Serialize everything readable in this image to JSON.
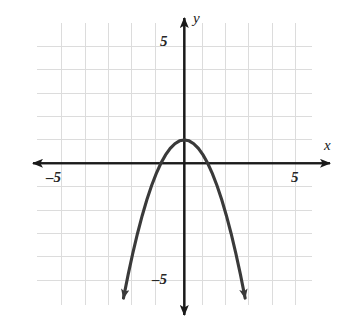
{
  "figure": {
    "kind": "coordinate-plane-graph",
    "background_color": "#ffffff",
    "grid_color": "#dcdcdc",
    "axis_color": "#1a1a1a",
    "curve_color": "#3a3a3a"
  },
  "labels": {
    "axis_x_name": "x",
    "axis_y_name": "y",
    "x_positive_tick": "5",
    "x_negative_tick": "–5",
    "y_positive_tick": "5",
    "y_negative_tick": "–5"
  },
  "chart_data": {
    "type": "line",
    "title": "",
    "subtitle": "",
    "xlabel": "x",
    "ylabel": "y",
    "xlim": [
      -6.3,
      5.1
    ],
    "ylim": [
      -6.0,
      6.0
    ],
    "grid": true,
    "grid_step": 1,
    "legend": "none",
    "x_ticks": [
      -5,
      5
    ],
    "x_tick_labels": [
      "–5",
      "5"
    ],
    "y_ticks": [
      -5,
      5
    ],
    "y_tick_labels": [
      "–5",
      "5"
    ],
    "axis_arrows": [
      "left",
      "right",
      "up",
      "down"
    ],
    "annotations": [],
    "series": [
      {
        "name": "y = 1 - x^2",
        "equation": "y = 1 - x²",
        "shape": "downward-opening parabola",
        "vertex": [
          0,
          1
        ],
        "x_intercepts": [
          -1,
          1
        ],
        "y_intercept": 1,
        "direction": "opens downward",
        "end_arrows": [
          "down-left",
          "down-right"
        ],
        "x": [
          -2.6,
          -2.4,
          -2.2,
          -2.0,
          -1.8,
          -1.6,
          -1.4,
          -1.2,
          -1.0,
          -0.8,
          -0.6,
          -0.4,
          -0.2,
          0.0,
          0.2,
          0.4,
          0.6,
          0.8,
          1.0,
          1.2,
          1.4,
          1.6,
          1.8,
          2.0,
          2.2,
          2.4,
          2.6
        ],
        "values": [
          -5.76,
          -4.76,
          -3.84,
          -3.0,
          -2.24,
          -1.56,
          -0.96,
          -0.44,
          0.0,
          0.36,
          0.64,
          0.84,
          0.96,
          1.0,
          0.96,
          0.84,
          0.64,
          0.36,
          0.0,
          -0.44,
          -0.96,
          -1.56,
          -2.24,
          -3.0,
          -3.84,
          -4.76,
          -5.76
        ]
      }
    ]
  }
}
